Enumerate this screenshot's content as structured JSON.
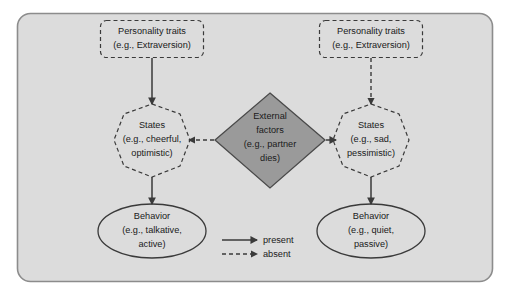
{
  "diagram": {
    "canvas": {
      "width": 510,
      "height": 295
    },
    "colors": {
      "panel_fill": "#dcdcdc",
      "panel_stroke": "#8c8c8c",
      "diamond_fill": "#9a9a9a",
      "diamond_stroke": "#4a4a4a",
      "line": "#3a3a3a",
      "text": "#1a1a1a",
      "page_background": "#ffffff"
    }
  },
  "nodes": {
    "traits_left": {
      "shape": "dashed-rounded-rectangle",
      "line1": "Personality traits",
      "line2": "(e.g., Extraversion)"
    },
    "traits_right": {
      "shape": "dashed-rounded-rectangle",
      "line1": "Personality traits",
      "line2": "(e.g., Extraversion)"
    },
    "states_left": {
      "shape": "dashed-polygon",
      "line1": "States",
      "line2": "(e.g., cheerful,",
      "line3": "optimistic)"
    },
    "states_right": {
      "shape": "dashed-polygon",
      "line1": "States",
      "line2": "(e.g., sad,",
      "line3": "pessimistic)"
    },
    "behavior_left": {
      "shape": "solid-ellipse",
      "line1": "Behavior",
      "line2": "(e.g., talkative,",
      "line3": "active)"
    },
    "behavior_right": {
      "shape": "solid-ellipse",
      "line1": "Behavior",
      "line2": "(e.g., quiet,",
      "line3": "passive)"
    },
    "external_factors": {
      "shape": "solid-diamond",
      "line1": "External",
      "line2": "factors",
      "line3": "(e.g., partner",
      "line4": "dies)"
    }
  },
  "edges": [
    {
      "name": "traits-left-to-states-left",
      "style": "solid",
      "from": "traits_left",
      "to": "states_left"
    },
    {
      "name": "states-left-to-behavior-left",
      "style": "solid",
      "from": "states_left",
      "to": "behavior_left"
    },
    {
      "name": "external-to-states-left",
      "style": "dashed",
      "from": "external_factors",
      "to": "states_left"
    },
    {
      "name": "traits-right-to-states-right",
      "style": "dashed",
      "from": "traits_right",
      "to": "states_right"
    },
    {
      "name": "external-to-states-right",
      "style": "solid",
      "from": "external_factors",
      "to": "states_right"
    },
    {
      "name": "states-right-to-behavior-right",
      "style": "solid",
      "from": "states_right",
      "to": "behavior_right"
    }
  ],
  "legend": {
    "items": [
      {
        "style": "solid",
        "label": "present"
      },
      {
        "style": "dashed",
        "label": "absent"
      }
    ]
  }
}
